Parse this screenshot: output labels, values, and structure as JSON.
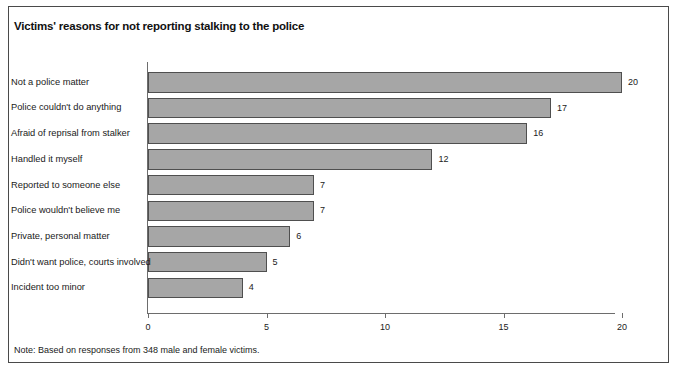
{
  "figure": {
    "title": "Victims' reasons for not reporting stalking to the police",
    "note": "Note: Based on responses from 348 male and female victims."
  },
  "style": {
    "bar_fill": "#a6a6a6",
    "bar_stroke": "#4f4f4f",
    "axis_color": "#6d6d6d",
    "frame_color": "#4a4a4a",
    "text_color": "#1a1a1a",
    "background": "#ffffff"
  },
  "chart_data": {
    "type": "bar",
    "orientation": "horizontal",
    "title": "Victims' reasons for not reporting stalking to the police",
    "xlabel": "",
    "ylabel": "",
    "xlim": [
      0,
      20
    ],
    "xticks": [
      0,
      5,
      10,
      15,
      20
    ],
    "xtick_labels": [
      "0",
      "5",
      "10",
      "15",
      "20"
    ],
    "grid": false,
    "legend": false,
    "data_labels": true,
    "categories": [
      "Not a police matter",
      "Police couldn't do anything",
      "Afraid of reprisal from stalker",
      "Handled it myself",
      "Reported to someone else",
      "Police wouldn't believe me",
      "Private, personal matter",
      "Didn't want police, courts involved",
      "Incident too minor"
    ],
    "values": [
      20,
      17,
      16,
      12,
      7,
      7,
      6,
      5,
      4
    ],
    "value_labels": [
      "20",
      "17",
      "16",
      "12",
      "7",
      "7",
      "6",
      "5",
      "4"
    ],
    "note": "Note: Based on responses from 348 male and female victims."
  }
}
